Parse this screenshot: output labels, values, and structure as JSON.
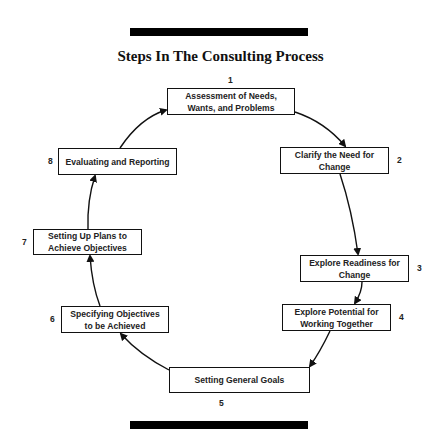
{
  "title": "Steps In The Consulting Process",
  "steps": [
    {
      "number": "1",
      "label": "Assessment of Needs, Wants, and Problems"
    },
    {
      "number": "2",
      "label": "Clarify the Need for Change"
    },
    {
      "number": "3",
      "label": "Explore Readiness for Change"
    },
    {
      "number": "4",
      "label": "Explore Potential for Working Together"
    },
    {
      "number": "5",
      "label": "Setting General Goals"
    },
    {
      "number": "6",
      "label": "Specifying Objectives to be Achieved"
    },
    {
      "number": "7",
      "label": "Setting Up Plans to Achieve Objectives"
    },
    {
      "number": "8",
      "label": "Evaluating and Reporting"
    }
  ],
  "colors": {
    "line": "#111111",
    "bars": "#000000"
  }
}
